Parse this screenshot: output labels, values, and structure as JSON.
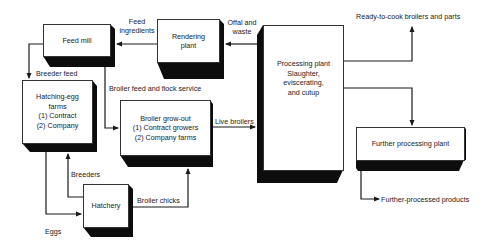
{
  "diagram": {
    "type": "flow-diagram",
    "nodes": {
      "feed_mill": {
        "label": "Feed mill"
      },
      "rendering_plant": {
        "label": "Rendering\nplant"
      },
      "processing_plant": {
        "label": "Processing plant\nSlaughter,\neviscerating,\nand cutup"
      },
      "hatching_egg_farms": {
        "label": "Hatching-egg\nfarms\n(1) Contract\n(2) Company"
      },
      "broiler_growout": {
        "label": "Broiler grow-out\n(1) Contract growers\n(2) Company farms"
      },
      "hatchery": {
        "label": "Hatchery"
      },
      "further_processing": {
        "label": "Further processing plant"
      }
    },
    "edges": {
      "feed_ingredients": "Feed\ningredients",
      "offal_and_waste": "Offal and\nwaste",
      "breeder_feed": "Breeder feed",
      "broiler_feed_flock_service": "Broiler feed and flock service",
      "live_broilers": "Live broilers",
      "breeders": "Breeders",
      "eggs": "Eggs",
      "broiler_chicks": "Broiler chicks",
      "ready_to_cook": "Ready-to-cook broilers and parts",
      "further_processed_products": "Further-processed products"
    },
    "colors": {
      "line": "#1a1a1a",
      "shadow": "#0d0d0d",
      "box_fill": "#ffffff"
    }
  }
}
